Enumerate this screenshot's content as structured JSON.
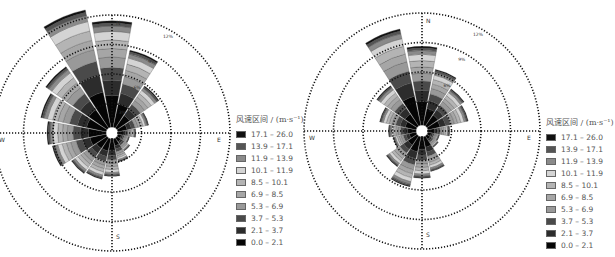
{
  "chart_data": [
    {
      "type": "windrose",
      "panel": "left",
      "directions": [
        "N",
        "NNE",
        "NE",
        "ENE",
        "E",
        "ESE",
        "SE",
        "SSE",
        "S",
        "SSW",
        "SW",
        "WSW",
        "W",
        "WNW",
        "NW",
        "NNW"
      ],
      "axis_labels": {
        "N": "N",
        "E": "E",
        "S": "S",
        "W": "W"
      },
      "ring_labels": [
        "3%",
        "6%",
        "9%",
        "12%"
      ],
      "ring_values": [
        3,
        6,
        9,
        12
      ],
      "rmax": 12,
      "legend_title": "风速区间 / (m·s⁻¹)",
      "bins": [
        "0.0 – 2.1",
        "2.1 – 3.7",
        "3.7 – 5.3",
        "5.3 – 6.9",
        "6.9 – 8.5",
        "8.5 – 10.1",
        "10.1 – 11.9",
        "11.9 – 13.9",
        "13.9 – 17.1",
        "17.1 – 26.0"
      ],
      "series_totals": [
        10.8,
        8.0,
        5.2,
        3.2,
        1.8,
        1.2,
        1.6,
        2.4,
        3.8,
        4.2,
        4.4,
        5.6,
        6.0,
        6.8,
        7.6,
        12.2
      ]
    },
    {
      "type": "windrose",
      "panel": "right",
      "directions": [
        "N",
        "NNE",
        "NE",
        "ENE",
        "E",
        "ESE",
        "SE",
        "SSE",
        "S",
        "SSW",
        "SW",
        "WSW",
        "W",
        "WNW",
        "NW",
        "NNW"
      ],
      "axis_labels": {
        "N": "N",
        "E": "E",
        "S": "S",
        "W": "W"
      },
      "ring_labels": [
        "3%",
        "6%",
        "9%",
        "12%"
      ],
      "ring_values": [
        3,
        6,
        9,
        12
      ],
      "rmax": 12,
      "legend_title": "风速区间 / (m·s⁻¹)",
      "bins": [
        "0.0 – 2.1",
        "2.1 – 3.7",
        "3.7 – 5.3",
        "5.3 – 6.9",
        "6.9 – 8.5",
        "8.5 – 10.1",
        "10.1 – 11.9",
        "11.9 – 13.9",
        "13.9 – 17.1",
        "17.1 – 26.0"
      ],
      "series_totals": [
        8.0,
        5.8,
        4.6,
        4.2,
        2.2,
        1.2,
        1.4,
        3.6,
        4.2,
        5.2,
        3.8,
        2.4,
        2.8,
        3.8,
        5.0,
        10.0
      ]
    }
  ],
  "legend": {
    "title": "风速区间 / (m·s⁻¹)",
    "items": [
      {
        "label": "17.1 – 26.0",
        "color": "#111111"
      },
      {
        "label": "13.9 – 17.1",
        "color": "#555555"
      },
      {
        "label": "11.9 – 13.9",
        "color": "#8a8a8a"
      },
      {
        "label": "10.1 – 11.9",
        "color": "#d4d4d4"
      },
      {
        "label": "8.5 – 10.1",
        "color": "#b4b4b4"
      },
      {
        "label": "6.9 – 8.5",
        "color": "#a6a6a6"
      },
      {
        "label": "5.3 – 6.9",
        "color": "#999999"
      },
      {
        "label": "3.7 – 5.3",
        "color": "#4a4a4a"
      },
      {
        "label": "2.1 – 3.7",
        "color": "#2c2c2c"
      },
      {
        "label": "0.0 – 2.1",
        "color": "#050505"
      }
    ]
  }
}
